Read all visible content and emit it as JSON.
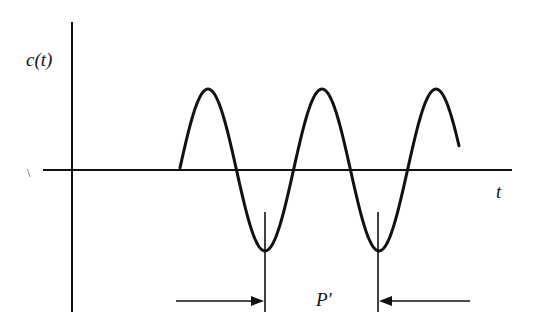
{
  "diagram": {
    "type": "periodic-waveform",
    "y_axis_label": "c(t)",
    "x_axis_label": "t",
    "period_label": "P′",
    "stray_mark": "\\",
    "colors": {
      "ink": "#111111",
      "background": "#ffffff"
    }
  },
  "waveform": {
    "shape": "sinusoid",
    "start_px": [
      180,
      165
    ],
    "end_px": [
      459,
      135
    ],
    "peaks_px_x": [
      208,
      322,
      436
    ],
    "troughs_px_x": [
      265,
      378
    ],
    "baseline_y_px": 170,
    "amplitude_px": 81
  }
}
